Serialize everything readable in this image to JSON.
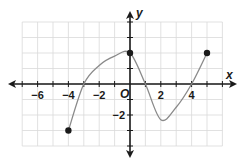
{
  "chart_data": {
    "type": "line",
    "title": "",
    "xlabel": "x",
    "ylabel": "y",
    "origin_label": "O",
    "xlim": [
      -7,
      6
    ],
    "ylim": [
      -4,
      4
    ],
    "grid": true,
    "x_tick_labels": [
      "-6",
      "-4",
      "-2",
      "2",
      "4"
    ],
    "x_tick_values": [
      -6,
      -4,
      -2,
      2,
      4
    ],
    "y_tick_labels": [
      "-2"
    ],
    "y_tick_values": [
      -2
    ],
    "series": [
      {
        "name": "f(x)",
        "x": [
          -4,
          -3,
          -2,
          -1,
          0,
          1,
          2,
          3,
          4,
          5
        ],
        "y": [
          -3,
          0,
          1.2,
          1.8,
          2,
          0,
          -2.3,
          -1.5,
          0,
          2
        ],
        "endpoints": [
          [
            -4,
            -3
          ],
          [
            5,
            2
          ]
        ],
        "marked_points": [
          [
            -4,
            -3
          ],
          [
            0,
            2
          ],
          [
            5,
            2
          ]
        ]
      }
    ],
    "colors": {
      "curve": "#8a8a8a",
      "axis": "#1a1a1a",
      "grid": "#d9d9d9",
      "point": "#1a1a1a"
    }
  }
}
